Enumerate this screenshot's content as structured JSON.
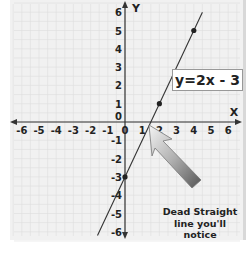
{
  "chart_data": {
    "type": "line",
    "title": "",
    "xlabel": "X",
    "ylabel": "Y",
    "xlim": [
      -6,
      6
    ],
    "ylim": [
      -6,
      6
    ],
    "grid": true,
    "x_ticks": [
      "-6",
      "-5",
      "-4",
      "-3",
      "-2",
      "-1",
      "0",
      "1",
      "2",
      "3",
      "4",
      "5",
      "6"
    ],
    "y_ticks": [
      "6",
      "5",
      "4",
      "3",
      "2",
      "1",
      "0",
      "-1",
      "-2",
      "-3",
      "-4",
      "-5",
      "-6"
    ],
    "series": [
      {
        "name": "y=2x - 3",
        "equation": "y=2x - 3",
        "x": [
          0,
          2,
          4
        ],
        "y": [
          -3,
          1,
          5
        ]
      }
    ],
    "annotations": [
      {
        "text": "y=2x - 3",
        "type": "label-box"
      },
      {
        "text": "Dead Straight line you'll notice",
        "type": "arrow-callout",
        "points_to": [
          1.5,
          0
        ]
      }
    ]
  },
  "labels": {
    "x_axis": "X",
    "y_axis": "Y",
    "equation": "y=2x - 3",
    "note_line1": "Dead Straight",
    "note_line2": "line you'll",
    "note_line3": "notice"
  }
}
